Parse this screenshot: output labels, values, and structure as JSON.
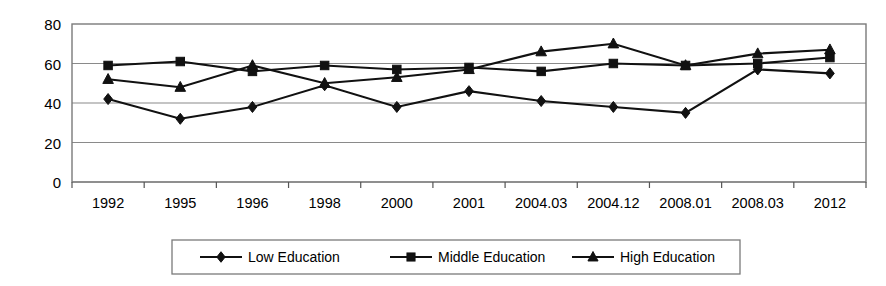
{
  "chart_data": {
    "type": "line",
    "title": "",
    "subtitle": "",
    "xlabel": "",
    "ylabel": "",
    "ylim": [
      0,
      80
    ],
    "yticks": [
      0,
      20,
      40,
      60,
      80
    ],
    "grid": true,
    "legend_position": "bottom",
    "categories": [
      "1992",
      "1995",
      "1996",
      "1998",
      "2000",
      "2001",
      "2004.03",
      "2004.12",
      "2008.01",
      "2008.03",
      "2012"
    ],
    "series": [
      {
        "name": "Low Education",
        "marker": "diamond",
        "color": "#111111",
        "values": [
          42,
          32,
          38,
          49,
          38,
          46,
          41,
          38,
          35,
          57,
          55
        ]
      },
      {
        "name": "Middle Education",
        "marker": "square",
        "color": "#111111",
        "values": [
          59,
          61,
          56,
          59,
          57,
          58,
          56,
          60,
          59,
          60,
          63
        ]
      },
      {
        "name": "High Education",
        "marker": "triangle",
        "color": "#111111",
        "values": [
          52,
          48,
          59,
          50,
          53,
          57,
          66,
          70,
          59,
          65,
          67
        ]
      }
    ]
  },
  "legend": {
    "items": [
      {
        "label": "Low Education",
        "marker": "diamond"
      },
      {
        "label": "Middle Education",
        "marker": "square"
      },
      {
        "label": "High Education",
        "marker": "triangle"
      }
    ]
  },
  "colors": {
    "series": "#111111",
    "grid": "#8a8a8a",
    "border": "#7a7a7a",
    "background": "#ffffff"
  }
}
